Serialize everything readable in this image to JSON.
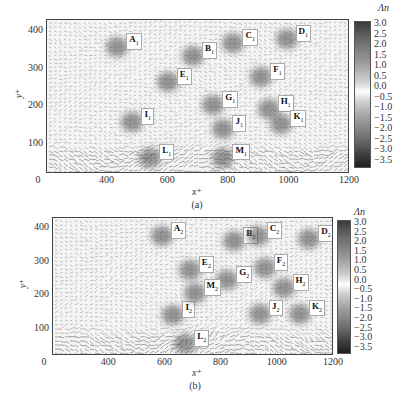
{
  "chart_data": [
    {
      "type": "heatmap",
      "title": "",
      "subfigure": "(a)",
      "xlabel": "x+",
      "ylabel": "y+",
      "xlim": [
        0,
        1200
      ],
      "ylim": [
        0,
        430
      ],
      "x_ticks": [
        "0",
        "400",
        "600",
        "800",
        "1000",
        "1200"
      ],
      "y_ticks": [
        "100",
        "200",
        "300",
        "400"
      ],
      "colorbar": {
        "label": "Λn",
        "range": [
          -3.5,
          3.0
        ],
        "ticks": [
          "3.0",
          "2.5",
          "2.0",
          "1.5",
          "1.0",
          "0.5",
          "0.0",
          "−0.5",
          "−1.0",
          "−1.5",
          "−2.0",
          "−2.5",
          "−3.0",
          "−3.5"
        ]
      },
      "grid": false,
      "overlay": "velocity vector field",
      "annotations": [
        {
          "label": "A",
          "sub": "1",
          "x": 330,
          "y": 380
        },
        {
          "label": "B",
          "sub": "1",
          "x": 630,
          "y": 355
        },
        {
          "label": "C",
          "sub": "1",
          "x": 790,
          "y": 390
        },
        {
          "label": "D",
          "sub": "1",
          "x": 1000,
          "y": 400
        },
        {
          "label": "E",
          "sub": "1",
          "x": 530,
          "y": 285
        },
        {
          "label": "F",
          "sub": "1",
          "x": 900,
          "y": 300
        },
        {
          "label": "G",
          "sub": "1",
          "x": 710,
          "y": 225
        },
        {
          "label": "H",
          "sub": "1",
          "x": 930,
          "y": 215
        },
        {
          "label": "I",
          "sub": "1",
          "x": 390,
          "y": 180
        },
        {
          "label": "J",
          "sub": "1",
          "x": 750,
          "y": 160
        },
        {
          "label": "K",
          "sub": "1",
          "x": 980,
          "y": 175
        },
        {
          "label": "L",
          "sub": "1",
          "x": 460,
          "y": 85
        },
        {
          "label": "M",
          "sub": "1",
          "x": 750,
          "y": 85
        }
      ]
    },
    {
      "type": "heatmap",
      "title": "",
      "subfigure": "(b)",
      "xlabel": "x+",
      "ylabel": "y+",
      "xlim": [
        0,
        1200
      ],
      "ylim": [
        0,
        430
      ],
      "x_ticks": [
        "0",
        "400",
        "600",
        "800",
        "1000",
        "1200"
      ],
      "y_ticks": [
        "100",
        "200",
        "300",
        "400"
      ],
      "colorbar": {
        "label": "Λn",
        "range": [
          -3.5,
          3.0
        ],
        "ticks": [
          "3.0",
          "2.5",
          "2.0",
          "1.5",
          "1.0",
          "0.5",
          "0.0",
          "−0.5",
          "−1.0",
          "−1.5",
          "−2.0",
          "−2.5",
          "−3.0",
          "−3.5"
        ]
      },
      "grid": false,
      "overlay": "velocity vector field",
      "annotations": [
        {
          "label": "A",
          "sub": "2",
          "x": 520,
          "y": 400
        },
        {
          "label": "B",
          "sub": "2",
          "x": 830,
          "y": 385
        },
        {
          "label": "C",
          "sub": "2",
          "x": 930,
          "y": 400
        },
        {
          "label": "D",
          "sub": "2",
          "x": 1150,
          "y": 390
        },
        {
          "label": "E",
          "sub": "2",
          "x": 640,
          "y": 300
        },
        {
          "label": "F",
          "sub": "2",
          "x": 960,
          "y": 305
        },
        {
          "label": "G",
          "sub": "2",
          "x": 800,
          "y": 270
        },
        {
          "label": "H",
          "sub": "2",
          "x": 1040,
          "y": 245
        },
        {
          "label": "I",
          "sub": "2",
          "x": 570,
          "y": 165
        },
        {
          "label": "J",
          "sub": "2",
          "x": 940,
          "y": 170
        },
        {
          "label": "K",
          "sub": "2",
          "x": 1110,
          "y": 170
        },
        {
          "label": "L",
          "sub": "2",
          "x": 620,
          "y": 80
        },
        {
          "label": "M",
          "sub": "2",
          "x": 660,
          "y": 230
        }
      ]
    }
  ],
  "panels": [
    {
      "caption": "(a)",
      "xlabel": "x⁺",
      "ylabel": "y⁺",
      "cbar_title": "Λn"
    },
    {
      "caption": "(b)",
      "xlabel": "x⁺",
      "ylabel": "y⁺",
      "cbar_title": "Λn"
    }
  ]
}
